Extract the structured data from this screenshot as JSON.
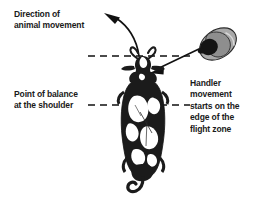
{
  "diagram": {
    "background_color": "#ffffff",
    "text_color": "#1a1a1a",
    "labels": {
      "direction_of_movement": "Direction of\nanimal movement",
      "point_of_balance": "Point of balance\nat the shoulder",
      "handler_movement": "Handler\nmovement\nstarts on the\nedge of the\nflight zone"
    },
    "figures": {
      "animal": {
        "name": "cow-top-view",
        "description": "Black and white Holstein cow seen from above, head at top with horns and ears, curled tail at bottom",
        "coat_dark_color": "#1b1b1b",
        "coat_light_color": "#ffffff"
      },
      "handler": {
        "name": "handler-top-view",
        "description": "Handler seen from above wearing a wide brimmed hat",
        "hat_color": "#a8a8a8",
        "head_color": "#141414"
      }
    },
    "guides": {
      "flight_zone_edge_line": "dashed horizontal line at head level",
      "point_of_balance_line": "dashed horizontal line at shoulder level",
      "dash_color": "#111111"
    },
    "arrows": {
      "animal_movement_arrow": "curved arrow sweeping up and to the left",
      "handler_movement_arrow": "straight arrow from handler toward the animal head"
    }
  }
}
